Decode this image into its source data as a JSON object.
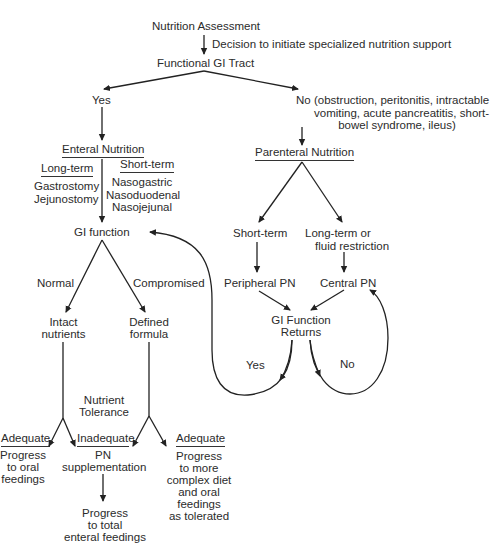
{
  "diagram": {
    "title": "Nutrition Assessment",
    "decision_label": "Decision to initiate specialized nutrition support",
    "functional_gi": "Functional GI Tract",
    "yes_label": "Yes",
    "no_label": "No",
    "no_reasons": [
      "(obstruction, peritonitis, intractable",
      "vomiting, acute pancreatitis, short-",
      "bowel syndrome, ileus)"
    ],
    "enteral": {
      "title": "Enteral Nutrition",
      "long_term": {
        "label": "Long-term",
        "items": [
          "Gastrostomy",
          "Jejunostomy"
        ]
      },
      "short_term": {
        "label": "Short-term",
        "items": [
          "Nasogastric",
          "Nasoduodenal",
          "Nasojejunal"
        ]
      },
      "gi_function": "GI function",
      "normal_label": "Normal",
      "compromised_label": "Compromised",
      "intact": [
        "Intact",
        "nutrients"
      ],
      "defined": [
        "Defined",
        "formula"
      ],
      "tolerance": [
        "Nutrient",
        "Tolerance"
      ],
      "adequate_left": {
        "label": "Adequate",
        "lines": [
          "Progress",
          "to oral",
          "feedings"
        ]
      },
      "inadequate": {
        "label": "Inadequate",
        "lines": [
          "PN",
          "supplementation"
        ]
      },
      "adequate_right": {
        "label": "Adequate",
        "lines": [
          "Progress",
          "to more",
          "complex diet",
          "and oral",
          "feedings",
          "as  tolerated"
        ]
      },
      "progress_total": [
        "Progress",
        "to total",
        "enteral feedings"
      ]
    },
    "parenteral": {
      "title": "Parenteral Nutrition",
      "short_term": "Short-term",
      "long_term": [
        "Long-term or",
        "fluid restriction"
      ],
      "peripheral": "Peripheral PN",
      "central": "Central PN",
      "gi_returns": [
        "GI Function",
        "Returns"
      ],
      "yes_label": "Yes",
      "no_label": "No"
    }
  }
}
